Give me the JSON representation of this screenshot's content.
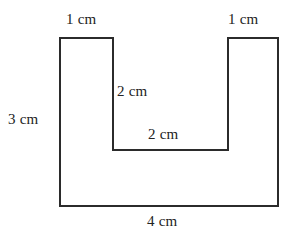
{
  "figure": {
    "type": "u-shaped-polygon",
    "stroke_color": "#2b2b2b",
    "stroke_width": 2,
    "fill_color": "#ffffff",
    "background_color": "#ffffff",
    "unit": "cm",
    "outline_points": "60,38 113,38 113,150 228,150 228,38 278,38 278,206 60,206",
    "labels": {
      "top_left_arm_width": "1 cm",
      "top_right_arm_width": "1 cm",
      "left_height": "3 cm",
      "notch_depth": "2 cm",
      "notch_width": "2 cm",
      "bottom_width": "4 cm"
    },
    "dimensions": [
      {
        "name": "top-left-arm-width",
        "value": 1,
        "unit": "cm",
        "text": "1 cm",
        "edge": "top-left horizontal"
      },
      {
        "name": "top-right-arm-width",
        "value": 1,
        "unit": "cm",
        "text": "1 cm",
        "edge": "top-right horizontal"
      },
      {
        "name": "left-side-height",
        "value": 3,
        "unit": "cm",
        "text": "3 cm",
        "edge": "left vertical"
      },
      {
        "name": "notch-depth",
        "value": 2,
        "unit": "cm",
        "text": "2 cm",
        "edge": "notch left vertical"
      },
      {
        "name": "notch-width",
        "value": 2,
        "unit": "cm",
        "text": "2 cm",
        "edge": "notch bottom horizontal"
      },
      {
        "name": "bottom-width",
        "value": 4,
        "unit": "cm",
        "text": "4 cm",
        "edge": "bottom horizontal"
      }
    ]
  }
}
